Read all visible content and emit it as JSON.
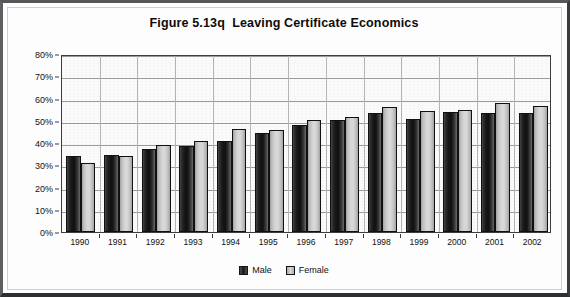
{
  "chart_data": {
    "type": "bar",
    "title": "Figure 5.13q  Leaving Certificate Economics",
    "xlabel": "",
    "ylabel": "",
    "ylim": [
      0,
      80
    ],
    "ytick_step": 10,
    "ytick_labels": [
      "0%",
      "10%",
      "20%",
      "30%",
      "40%",
      "50%",
      "60%",
      "70%",
      "80%"
    ],
    "grid": true,
    "legend_position": "bottom-center",
    "categories": [
      "1990",
      "1991",
      "1992",
      "1993",
      "1994",
      "1995",
      "1996",
      "1997",
      "1998",
      "1999",
      "2000",
      "2001",
      "2002"
    ],
    "series": [
      {
        "name": "Male",
        "color": "#1a1a1a",
        "values": [
          34,
          34.5,
          37.5,
          38.5,
          41,
          44.5,
          48,
          50.5,
          53.5,
          51,
          54,
          53.5,
          53.5
        ]
      },
      {
        "name": "Female",
        "color": "#d4d4d4",
        "values": [
          31,
          34,
          39,
          41,
          46.5,
          46,
          50.5,
          51.5,
          56,
          54.5,
          55,
          58,
          56.5
        ]
      }
    ]
  },
  "colors": {
    "axis": "#3c3d3f",
    "gridline": "#9a9a9c",
    "plot_background": "#fbfbfb",
    "page_background": "#ffffff",
    "frame_border": "#2e2f31",
    "text": "#111111"
  }
}
